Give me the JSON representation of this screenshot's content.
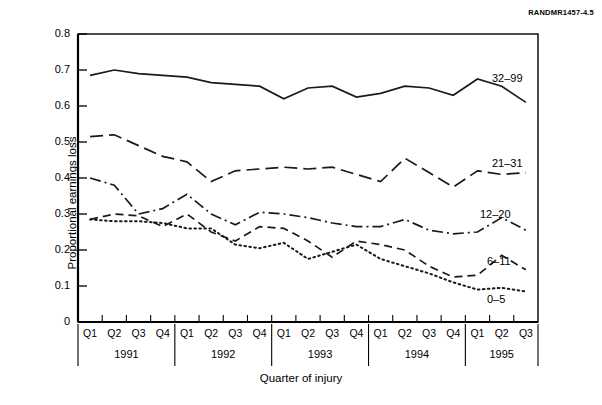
{
  "figure": {
    "id_tag": "RANDMR1457-4.5"
  },
  "chart_data": {
    "type": "line",
    "title": "",
    "xlabel": "Quarter of injury",
    "ylabel": "Proportional earnings loss",
    "ylim": [
      0,
      0.8
    ],
    "yticks": [
      0,
      0.1,
      0.2,
      0.3,
      0.4,
      0.5,
      0.6,
      0.7,
      0.8
    ],
    "ytick_labels": [
      "0",
      "0.1",
      "0.2",
      "0.3",
      "0.4",
      "0.5",
      "0.6",
      "0.7",
      "0.8"
    ],
    "grid": false,
    "legend_position": "inline-right-of-lines",
    "categories": [
      "Q1",
      "Q2",
      "Q3",
      "Q4",
      "Q1",
      "Q2",
      "Q3",
      "Q4",
      "Q1",
      "Q2",
      "Q3",
      "Q4",
      "Q1",
      "Q2",
      "Q3",
      "Q4",
      "Q1",
      "Q2",
      "Q3"
    ],
    "year_groups": [
      {
        "year": "1991",
        "quarters": [
          "Q1",
          "Q2",
          "Q3",
          "Q4"
        ]
      },
      {
        "year": "1992",
        "quarters": [
          "Q1",
          "Q2",
          "Q3",
          "Q4"
        ]
      },
      {
        "year": "1993",
        "quarters": [
          "Q1",
          "Q2",
          "Q3",
          "Q4"
        ]
      },
      {
        "year": "1994",
        "quarters": [
          "Q1",
          "Q2",
          "Q3",
          "Q4"
        ]
      },
      {
        "year": "1995",
        "quarters": [
          "Q1",
          "Q2",
          "Q3"
        ]
      }
    ],
    "series": [
      {
        "name": "32–99",
        "style": "solid",
        "values": [
          0.685,
          0.7,
          0.69,
          0.685,
          0.68,
          0.665,
          0.66,
          0.655,
          0.62,
          0.65,
          0.655,
          0.625,
          0.635,
          0.655,
          0.65,
          0.63,
          0.675,
          0.655,
          0.61
        ]
      },
      {
        "name": "21–31",
        "style": "dashed",
        "values": [
          0.515,
          0.52,
          0.49,
          0.46,
          0.445,
          0.39,
          0.42,
          0.425,
          0.43,
          0.425,
          0.43,
          0.41,
          0.39,
          0.455,
          0.415,
          0.375,
          0.42,
          0.41,
          0.415
        ]
      },
      {
        "name": "12–20",
        "style": "dash-dot",
        "values": [
          0.4,
          0.38,
          0.3,
          0.315,
          0.355,
          0.3,
          0.27,
          0.305,
          0.3,
          0.29,
          0.275,
          0.265,
          0.265,
          0.285,
          0.255,
          0.245,
          0.25,
          0.29,
          0.255
        ]
      },
      {
        "name": "6–11",
        "style": "dashed-short",
        "values": [
          0.285,
          0.3,
          0.295,
          0.265,
          0.3,
          0.25,
          0.225,
          0.265,
          0.26,
          0.225,
          0.18,
          0.225,
          0.215,
          0.2,
          0.155,
          0.125,
          0.13,
          0.185,
          0.145
        ]
      },
      {
        "name": "0–5",
        "style": "dotted",
        "values": [
          0.285,
          0.28,
          0.28,
          0.275,
          0.26,
          0.26,
          0.215,
          0.205,
          0.22,
          0.175,
          0.195,
          0.215,
          0.175,
          0.155,
          0.135,
          0.11,
          0.09,
          0.095,
          0.085
        ]
      }
    ]
  },
  "colors": {
    "line": "#1a1a1a",
    "axis": "#000000",
    "background": "#ffffff"
  }
}
